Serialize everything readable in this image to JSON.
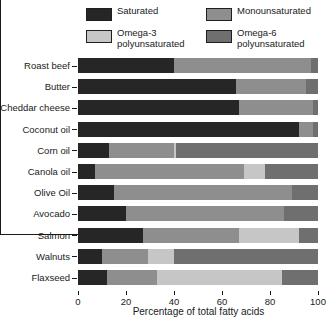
{
  "legend": {
    "items": [
      {
        "name": "saturated",
        "label": "Saturated",
        "color": "#262626"
      },
      {
        "name": "monounsaturated",
        "label": "Monounsaturated",
        "color": "#8e8e8e"
      },
      {
        "name": "omega3",
        "label": "Omega-3\npolyunsaturated",
        "color": "#c6c6c6"
      },
      {
        "name": "omega6",
        "label": "Omega-6\npolyunsaturated",
        "color": "#6f6f6f"
      }
    ]
  },
  "axis": {
    "x_title": "Percentage of total fatty acids",
    "x_ticks": [
      "0",
      "20",
      "40",
      "60",
      "80",
      "100"
    ],
    "x_min": 0,
    "x_max": 100
  },
  "chart_data": {
    "type": "bar",
    "orientation": "horizontal",
    "stacked": true,
    "title": "",
    "xlabel": "Percentage of total fatty acids",
    "ylabel": "",
    "xlim": [
      0,
      100
    ],
    "xticks": [
      0,
      20,
      40,
      60,
      80,
      100
    ],
    "grid": false,
    "legend_position": "top",
    "categories": [
      "Roast beef",
      "Butter",
      "Cheddar cheese",
      "Coconut oil",
      "Corn oil",
      "Canola oil",
      "Olive Oil",
      "Avocado",
      "Salmon",
      "Walnuts",
      "Flaxseed"
    ],
    "series": [
      {
        "name": "Saturated",
        "color": "#262626",
        "values": [
          40,
          66,
          67,
          92,
          13,
          7,
          15,
          20,
          27,
          10,
          12
        ]
      },
      {
        "name": "Monounsaturated",
        "color": "#8e8e8e",
        "values": [
          57,
          29,
          31,
          6,
          27,
          62,
          74,
          66,
          40,
          19,
          21
        ]
      },
      {
        "name": "Omega-3 polyunsaturated",
        "color": "#c6c6c6",
        "values": [
          0,
          0,
          0,
          0,
          1,
          9,
          0,
          0,
          25,
          11,
          52
        ]
      },
      {
        "name": "Omega-6 polyunsaturated",
        "color": "#6f6f6f",
        "values": [
          3,
          5,
          2,
          2,
          59,
          22,
          11,
          14,
          8,
          60,
          15
        ]
      }
    ]
  }
}
